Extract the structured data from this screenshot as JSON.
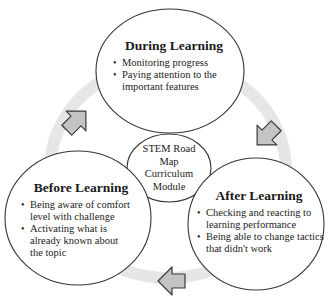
{
  "colors": {
    "ring": "#e6e6e6",
    "arrow_fill": "#c4c4c4",
    "arrow_stroke": "#3a3a3a",
    "circle_stroke": "#333333",
    "background": "#ffffff"
  },
  "diagram": {
    "center": {
      "lines": [
        "STEM Road",
        "Map",
        "Curriculum",
        "Module"
      ]
    },
    "during": {
      "title": "During Learning",
      "items": [
        "Monitoring progress",
        "Paying attention to the important features"
      ]
    },
    "after": {
      "title": "After Learning",
      "items": [
        "Checking and reacting to learning performance",
        "Being able to change tactics that didn't work"
      ]
    },
    "before": {
      "title": "Before Learning",
      "items": [
        "Being aware of comfort level with challenge",
        "Activating what is already known about the topic"
      ]
    },
    "arrows": [
      {
        "name": "arrow-during-to-after",
        "direction": "down-right"
      },
      {
        "name": "arrow-after-to-before",
        "direction": "left"
      },
      {
        "name": "arrow-before-to-during",
        "direction": "up-right"
      }
    ]
  }
}
